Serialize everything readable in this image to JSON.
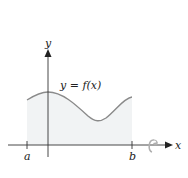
{
  "diagram": {
    "curve_label": "y = f(x)",
    "axes": {
      "x_label": "x",
      "y_label": "y"
    },
    "tick_labels": {
      "left": "a",
      "right": "b"
    },
    "colors": {
      "axis": "#333333",
      "curve": "#8a8a8a",
      "region_fill": "#f1f3f4",
      "rotation_arrow": "#b0b0b0"
    },
    "annotations": [
      "rotation-arrow-around-x-axis"
    ]
  }
}
